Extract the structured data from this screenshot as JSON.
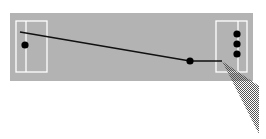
{
  "diagram": {
    "type": "field-play-diagram",
    "colors": {
      "field": "#b3b3b3",
      "lines": "#ffffff",
      "path": "#111111",
      "dots": "#000000",
      "cone": "#555555",
      "background": "#ffffff"
    },
    "field": {
      "x": 10,
      "y": 13,
      "w": 243,
      "h": 68
    },
    "left_box": {
      "x": 16,
      "y": 21,
      "w": 31,
      "h": 51,
      "inner_x": 26
    },
    "right_box": {
      "x": 216,
      "y": 21,
      "w": 31,
      "h": 51,
      "inner_x": 238
    },
    "dots": [
      {
        "name": "left-dot",
        "cx": 25,
        "cy": 45,
        "r": 3.6
      },
      {
        "name": "mid-dot",
        "cx": 190,
        "cy": 61,
        "r": 3.6
      },
      {
        "name": "right-dot-1",
        "cx": 237,
        "cy": 34,
        "r": 3.6
      },
      {
        "name": "right-dot-2",
        "cx": 237,
        "cy": 44,
        "r": 3.6
      },
      {
        "name": "right-dot-3",
        "cx": 237,
        "cy": 54,
        "r": 3.6
      }
    ],
    "path_points": [
      [
        20,
        32
      ],
      [
        190,
        61
      ],
      [
        222,
        61
      ]
    ],
    "cone_points": [
      [
        222,
        61
      ],
      [
        259,
        86
      ],
      [
        259,
        134
      ]
    ]
  }
}
